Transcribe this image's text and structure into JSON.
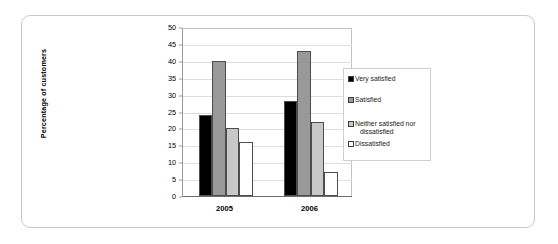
{
  "chart_data": {
    "type": "bar",
    "title": "",
    "xlabel": "",
    "ylabel": "Percentage of customers",
    "categories": [
      "2005",
      "2006"
    ],
    "ylim": [
      0,
      50
    ],
    "yticks": [
      0,
      5,
      10,
      15,
      20,
      25,
      30,
      35,
      40,
      45,
      50
    ],
    "grid": true,
    "legend_position": "right",
    "series": [
      {
        "name": "Very satisfied",
        "values": [
          24,
          28
        ],
        "color": "#000000"
      },
      {
        "name": "Satisfied",
        "values": [
          40,
          43
        ],
        "color": "#999999"
      },
      {
        "name": "Neither satisfied nor dissatisfied",
        "values": [
          20,
          22
        ],
        "color": "#c8c8c8"
      },
      {
        "name": "Dissatisfied",
        "values": [
          16,
          7
        ],
        "color": "#ffffff"
      }
    ]
  },
  "axis": {
    "y_title": "Percentage of customers",
    "y_tick_labels": [
      "50",
      "45",
      "40",
      "35",
      "30",
      "25",
      "20",
      "15",
      "10",
      "5",
      "0"
    ],
    "x_tick_labels": [
      "2005",
      "2006"
    ]
  },
  "legend": {
    "items": [
      {
        "label": "Very satisfied",
        "label_line2": ""
      },
      {
        "label": "Satisfied",
        "label_line2": ""
      },
      {
        "label": "Neither satisfied nor",
        "label_line2": "dissatisfied"
      },
      {
        "label": "Dissatisfied",
        "label_line2": ""
      }
    ]
  },
  "colors": {
    "frame_border": "#c9c9c9",
    "axis_line": "#6d6d6d",
    "gridline": "#dedede",
    "bar_outline": "#4d4d4d",
    "series_1": "#000000",
    "series_2": "#999999",
    "series_3": "#c8c8c8",
    "series_4": "#ffffff"
  }
}
